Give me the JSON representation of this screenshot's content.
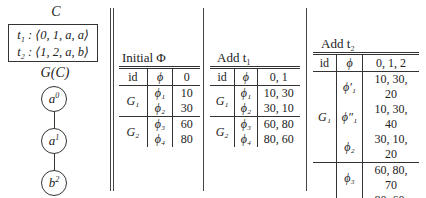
{
  "left_panel": {
    "c_label": "C",
    "tuples": [
      "t₁ : ⟨0, 1, a, a⟩",
      "t₂ : ⟨1, 2, a, b⟩"
    ],
    "graph_label": "G(C)",
    "nodes": [
      {
        "base": "a",
        "sup": "0"
      },
      {
        "base": "a",
        "sup": "1"
      },
      {
        "base": "b",
        "sup": "2"
      }
    ]
  },
  "tables": [
    {
      "title": "Initial Φ",
      "headers": [
        "id",
        "ϕ",
        "0"
      ],
      "groups": [
        {
          "id": "G₁",
          "rows": [
            [
              "ϕ₁",
              "10"
            ],
            [
              "ϕ₂",
              "30"
            ]
          ]
        },
        {
          "id": "G₂",
          "rows": [
            [
              "ϕ₃",
              "60"
            ],
            [
              "ϕ₄",
              "80"
            ]
          ]
        }
      ]
    },
    {
      "title": "Add t₁",
      "headers": [
        "id",
        "ϕ",
        "0, 1"
      ],
      "groups": [
        {
          "id": "G₁",
          "rows": [
            [
              "ϕ₁",
              "10, 30"
            ],
            [
              "ϕ₂",
              "30, 10"
            ]
          ]
        },
        {
          "id": "G₂",
          "rows": [
            [
              "ϕ₃",
              "60, 80"
            ],
            [
              "ϕ₄",
              "80, 60"
            ]
          ]
        }
      ]
    },
    {
      "title": "Add t₂",
      "headers": [
        "id",
        "ϕ",
        "0, 1, 2"
      ],
      "groups": [
        {
          "id": "G₁",
          "rows": [
            [
              "ϕ′₁",
              "10, 30, 20"
            ],
            [
              "ϕ″₁",
              "10, 30, 40"
            ],
            [
              "ϕ₂",
              "30, 10, 20"
            ]
          ]
        },
        {
          "id": "G₂",
          "rows": [
            [
              "ϕ₃",
              "60, 80, 70"
            ],
            [
              "ϕ′₄",
              "80, 60, 50"
            ],
            [
              "ϕ″₄",
              "80, 60, 70"
            ]
          ]
        }
      ]
    }
  ]
}
